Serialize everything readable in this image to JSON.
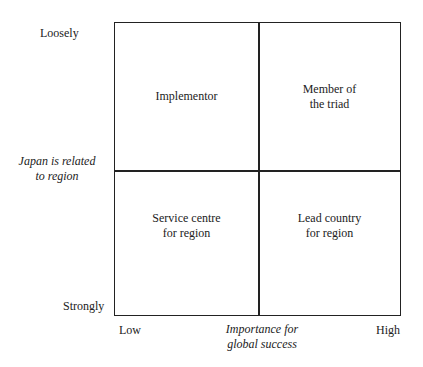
{
  "y_axis": {
    "top": "Loosely",
    "bottom": "Strongly",
    "title_line1": "Japan is related",
    "title_line2": "to region"
  },
  "x_axis": {
    "left": "Low",
    "right": "High",
    "title_line1": "Importance for",
    "title_line2": "global success"
  },
  "quadrants": {
    "top_left": {
      "line1": "Implementor",
      "line2": ""
    },
    "top_right": {
      "line1": "Member of",
      "line2": "the triad"
    },
    "bottom_left": {
      "line1": "Service centre",
      "line2": "for region"
    },
    "bottom_right": {
      "line1": "Lead country",
      "line2": "for region"
    }
  }
}
